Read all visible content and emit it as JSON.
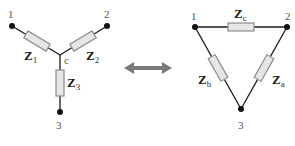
{
  "wye": {
    "nodes": [
      {
        "id": "1",
        "label": "1"
      },
      {
        "id": "2",
        "label": "2"
      },
      {
        "id": "3",
        "label": "3"
      }
    ],
    "center_label": "c",
    "impedances": [
      {
        "symbol": "Z",
        "sub": "1"
      },
      {
        "symbol": "Z",
        "sub": "2"
      },
      {
        "symbol": "Z",
        "sub": "3"
      }
    ]
  },
  "arrow": {
    "type": "double-headed",
    "color": "#7a7a7a"
  },
  "delta": {
    "nodes": [
      {
        "id": "1",
        "label": "1"
      },
      {
        "id": "2",
        "label": "2"
      },
      {
        "id": "3",
        "label": "3"
      }
    ],
    "impedances": [
      {
        "symbol": "Z",
        "sub": "c"
      },
      {
        "symbol": "Z",
        "sub": "b"
      },
      {
        "symbol": "Z",
        "sub": "a"
      }
    ]
  },
  "colors": {
    "wire": "#1a1a1a",
    "resistor_fill": "#e6e6e6",
    "resistor_stroke": "#8c8c8c",
    "node_label": "#555555"
  }
}
